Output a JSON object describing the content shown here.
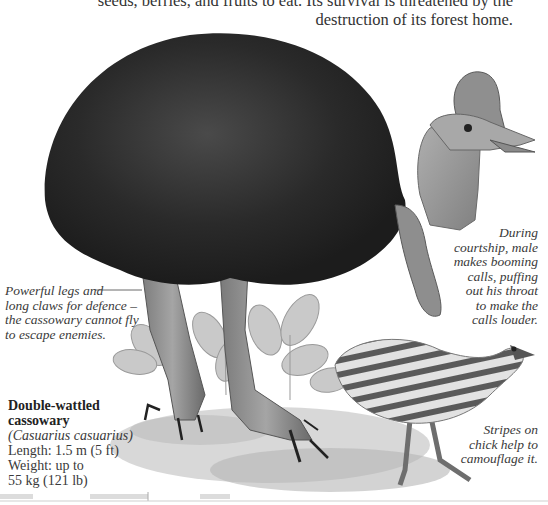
{
  "intro_text": {
    "line1": "seeds, berries, and fruits to eat. Its survival is threatened by the",
    "line2": "destruction of its forest home."
  },
  "illustration": {
    "subject": "adult double-wattled cassowary with chick among leaves",
    "palette": {
      "feathers": "#2b2b2b",
      "skin": "#9a9a9a",
      "leaves": "#c4c4c4",
      "ground": "#b8b8b8"
    }
  },
  "captions": {
    "legs": {
      "lines": [
        "Powerful legs and",
        "long claws for defence –",
        "the cassowary cannot fly",
        "to escape enemies."
      ]
    },
    "courtship": {
      "lines": [
        "During",
        "courtship, male",
        "makes booming",
        "calls, puffing",
        "out his throat",
        "to make the",
        "calls louder."
      ]
    },
    "chick": {
      "lines": [
        "Stripes on",
        "chick help to",
        "camouflage it."
      ]
    }
  },
  "fact_box": {
    "name_line1": "Double-wattled",
    "name_line2": "cassowary",
    "scientific": "(Casuarius casuarius)",
    "length": "Length: 1.5 m (5 ft)",
    "weight_line1": "Weight: up to",
    "weight_line2": "55 kg  (121 lb)"
  }
}
